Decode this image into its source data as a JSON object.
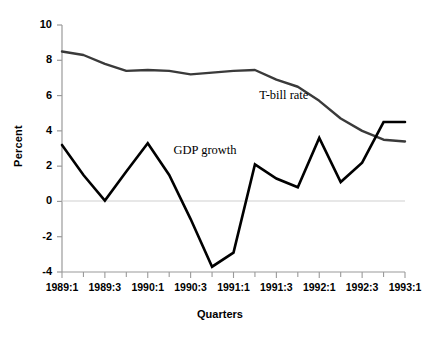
{
  "chart_data": {
    "type": "line",
    "title": "",
    "xlabel": "Quarters",
    "ylabel": "Percent",
    "ylim": [
      -4,
      10
    ],
    "yticks": [
      10,
      8,
      6,
      4,
      2,
      0,
      -2,
      -4
    ],
    "ytick_labels": [
      "10",
      "8",
      "6",
      "4",
      "2",
      "0",
      "-2",
      "-4"
    ],
    "x": [
      "1989:1",
      "1989:2",
      "1989:3",
      "1989:4",
      "1990:1",
      "1990:2",
      "1990:3",
      "1990:4",
      "1991:1",
      "1991:2",
      "1991:3",
      "1991:4",
      "1992:1",
      "1992:2",
      "1992:3",
      "1992:4",
      "1993:1"
    ],
    "xtick_labels": [
      "1989:1",
      "1989:3",
      "1990:1",
      "1990:3",
      "1991:1",
      "1991:3",
      "1992:1",
      "1992:3",
      "1993:1"
    ],
    "xtick_indices": [
      0,
      2,
      4,
      6,
      8,
      10,
      12,
      14,
      16
    ],
    "grid": false,
    "zero_line": true,
    "legend_position": "inline-annotation",
    "series": [
      {
        "name": "T-bill rate",
        "color": "#3a3a3a",
        "label_x_index": 9.2,
        "label_y": 6.0,
        "values": [
          8.5,
          8.3,
          7.8,
          7.4,
          7.45,
          7.4,
          7.2,
          7.3,
          7.4,
          7.45,
          6.9,
          6.5,
          5.7,
          4.7,
          4.0,
          3.5,
          3.4
        ]
      },
      {
        "name": "GDP growth",
        "color": "#000000",
        "label_x_index": 5.2,
        "label_y": 2.85,
        "values": [
          3.2,
          1.5,
          0.05,
          1.7,
          3.3,
          1.5,
          -1.0,
          -3.7,
          -2.9,
          2.1,
          1.3,
          0.8,
          3.6,
          1.1,
          2.2,
          4.5,
          4.5
        ]
      }
    ]
  },
  "axis": {
    "y_title": "Percent",
    "x_title": "Quarters"
  },
  "footnote": {
    "text": ""
  }
}
